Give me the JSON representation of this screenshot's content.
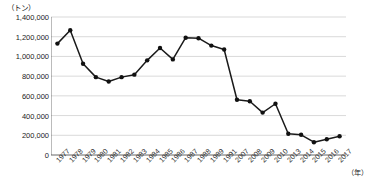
{
  "chart_data": {
    "type": "line",
    "title": "",
    "unit_label": "（トン）",
    "xlabel": "（年）",
    "ylabel": "",
    "ylim": [
      0,
      1400000
    ],
    "ytick_step": 200000,
    "ytick_labels": [
      "1,400,000",
      "1,200,000",
      "1,000,000",
      "800,000",
      "600,000",
      "400,000",
      "200,000",
      "0"
    ],
    "ytick_values": [
      1400000,
      1200000,
      1000000,
      800000,
      600000,
      400000,
      200000,
      0
    ],
    "grid": true,
    "legend": "none",
    "categories": [
      "1977",
      "1978",
      "1979",
      "1980",
      "1981",
      "1982",
      "1983",
      "1984",
      "1985",
      "1986",
      "1987",
      "1988",
      "1989",
      "1991",
      "2007",
      "2008",
      "2009",
      "2010",
      "2013",
      "2014",
      "2015",
      "2016",
      "2017"
    ],
    "values": [
      1130000,
      1265000,
      925000,
      790000,
      745000,
      790000,
      815000,
      960000,
      1085000,
      970000,
      1190000,
      1185000,
      1110000,
      1070000,
      560000,
      545000,
      430000,
      520000,
      215000,
      205000,
      130000,
      160000,
      190000
    ],
    "series": [
      {
        "name": "生産量",
        "values": [
          1130000,
          1265000,
          925000,
          790000,
          745000,
          790000,
          815000,
          960000,
          1085000,
          970000,
          1190000,
          1185000,
          1110000,
          1070000,
          560000,
          545000,
          430000,
          520000,
          215000,
          205000,
          130000,
          160000,
          190000
        ]
      }
    ],
    "marker": "circle",
    "line_color": "#1a1a1a",
    "marker_color": "#111111",
    "grid_color": "#c8c8c8",
    "axis_color": "#555555"
  }
}
